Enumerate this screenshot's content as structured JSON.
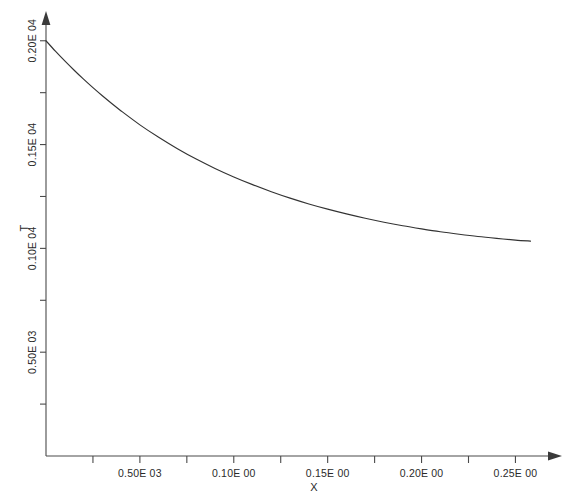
{
  "chart_data": {
    "type": "line",
    "title": "",
    "subtitle": "",
    "xlabel": "X",
    "ylabel": "T",
    "grid": false,
    "legend": null,
    "xlim": [
      0.0,
      0.27
    ],
    "ylim": [
      0.0,
      2100.0
    ],
    "x_tick_labels": [
      "0.50E 03",
      "0.10E 00",
      "0.15E 00",
      "0.20E 00",
      "0.25E 00"
    ],
    "x_tick_values": [
      0.05,
      0.1,
      0.15,
      0.2,
      0.25
    ],
    "x_minor_ticks": [
      0.025,
      0.075,
      0.125,
      0.175,
      0.225
    ],
    "y_tick_labels": [
      "0.20E 04",
      "0.15E 04",
      "0.10E 04",
      "0.50E 03"
    ],
    "y_tick_values": [
      2000,
      1500,
      1000,
      500
    ],
    "y_minor_ticks": [
      1750,
      1250,
      750,
      250
    ],
    "series": [
      {
        "name": "T(X)",
        "x": [
          0.0,
          0.005,
          0.01,
          0.015,
          0.02,
          0.025,
          0.03,
          0.035,
          0.04,
          0.05,
          0.06,
          0.07,
          0.08,
          0.09,
          0.1,
          0.11,
          0.12,
          0.13,
          0.14,
          0.15,
          0.16,
          0.17,
          0.18,
          0.19,
          0.2,
          0.21,
          0.22,
          0.23,
          0.24,
          0.25,
          0.258
        ],
        "values": [
          2000,
          1950,
          1903,
          1858,
          1815,
          1774,
          1735,
          1698,
          1662,
          1595,
          1535,
          1480,
          1430,
          1385,
          1344,
          1307,
          1273,
          1242,
          1214,
          1189,
          1166,
          1145,
          1126,
          1109,
          1094,
          1080,
          1068,
          1057,
          1048,
          1040,
          1035
        ]
      }
    ]
  },
  "axis": {
    "x_title": "X",
    "y_title": "T"
  }
}
